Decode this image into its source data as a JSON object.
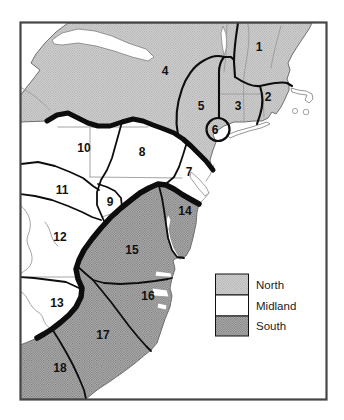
{
  "map": {
    "region_labels": [
      "1",
      "2",
      "3",
      "4",
      "5",
      "6",
      "7",
      "8",
      "9",
      "10",
      "11",
      "12",
      "13",
      "14",
      "15",
      "16",
      "17",
      "18"
    ]
  },
  "legend": {
    "items": [
      {
        "label": "North",
        "area": "north"
      },
      {
        "label": "Midland",
        "area": "midland"
      },
      {
        "label": "South",
        "area": "south"
      }
    ]
  },
  "colors": {
    "north_fill_effective": "#c6c6c6",
    "midland_fill": "#ffffff",
    "south_fill_effective": "#9a9a9a",
    "boundary_line": "#0d0d0d",
    "state_line": "#9a9a9a",
    "coast_line": "#6f6f6f",
    "frame": "#454545",
    "background": "#ffffff"
  }
}
